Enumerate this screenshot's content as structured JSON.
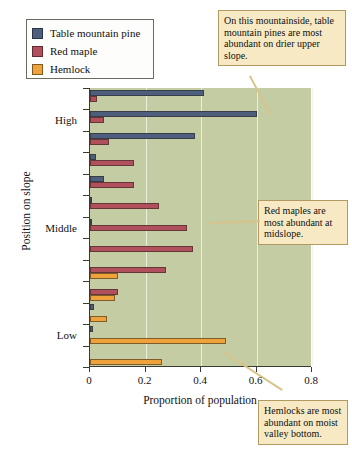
{
  "chart_data": {
    "type": "bar",
    "orientation": "horizontal",
    "title": "",
    "xlabel": "Proportion of population",
    "ylabel": "Position on slope",
    "xlim": [
      0,
      0.8
    ],
    "xticks": [
      0,
      0.2,
      0.4,
      0.6,
      0.8
    ],
    "xticklabels": [
      "0",
      "0.2",
      "0.4",
      "0.6",
      "0.8"
    ],
    "ycategories": [
      "High",
      "Middle",
      "Low"
    ],
    "ycategory_slots": [
      1,
      6,
      11
    ],
    "n_slots": 13,
    "grid": "vertical",
    "legend_position": "upper-left-outside",
    "plot_background": "#c3cca2",
    "series": [
      {
        "name": "Table mountain pine",
        "color": "#4e5f7d",
        "values": [
          0.41,
          0.6,
          0.38,
          0.02,
          0.05,
          0.005,
          0.005,
          0.0,
          0.0,
          0.0,
          0.015,
          0.01,
          0.0
        ]
      },
      {
        "name": "Red maple",
        "color": "#b0505c",
        "values": [
          0.025,
          0.05,
          0.07,
          0.16,
          0.16,
          0.25,
          0.35,
          0.37,
          0.275,
          0.1,
          0.0,
          0.0,
          0.0
        ]
      },
      {
        "name": "Hemlock",
        "color": "#eda23c",
        "values": [
          0.0,
          0.0,
          0.0,
          0.0,
          0.0,
          0.0,
          0.0,
          0.0,
          0.1,
          0.09,
          0.06,
          0.49,
          0.26
        ]
      }
    ]
  },
  "legend": {
    "items": [
      {
        "label": "Table mountain pine",
        "color": "#4e5f7d"
      },
      {
        "label": "Red maple",
        "color": "#b0505c"
      },
      {
        "label": "Hemlock",
        "color": "#eda23c"
      }
    ]
  },
  "axes": {
    "xtitle": "Proportion of population",
    "ytitle": "Position on slope",
    "xticklabels": [
      "0",
      "0.2",
      "0.4",
      "0.6",
      "0.8"
    ],
    "ycategories": [
      "High",
      "Middle",
      "Low"
    ]
  },
  "callouts": [
    {
      "id": "pine-note",
      "text": "On this mountainside, table mountain pines are most abundant on drier upper slope."
    },
    {
      "id": "maple-note",
      "text": "Red maples are most abundant at midslope."
    },
    {
      "id": "hemlock-note",
      "text": "Hemlocks are most abundant on moist valley bottom."
    }
  ]
}
